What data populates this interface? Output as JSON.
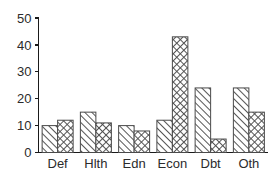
{
  "chart_data": {
    "type": "bar",
    "title": "",
    "subtitle": "",
    "xlabel": "",
    "ylabel": "",
    "categories": [
      "Def",
      "Hlth",
      "Edn",
      "Econ",
      "Dbt",
      "Oth"
    ],
    "series": [
      {
        "name": "series-1",
        "pattern": "diagonal-hatch",
        "values": [
          10,
          15,
          10,
          12,
          24,
          24
        ]
      },
      {
        "name": "series-2",
        "pattern": "crosshatch",
        "values": [
          12,
          11,
          8,
          43,
          5,
          15
        ]
      }
    ],
    "ylim": [
      0,
      50
    ],
    "yticks": [
      0,
      10,
      20,
      30,
      40,
      50
    ],
    "ytick_labels": [
      "0",
      "10",
      "20",
      "30",
      "40",
      "50"
    ],
    "grid": false,
    "legend": false,
    "legend_position": "none",
    "colors": {
      "axis": "#1a1a1a",
      "text": "#2b2b2b",
      "bar_outline": "#4a4a4a",
      "bar_fill": "#ffffff",
      "hatch": "#555555",
      "background": "#ffffff"
    }
  }
}
